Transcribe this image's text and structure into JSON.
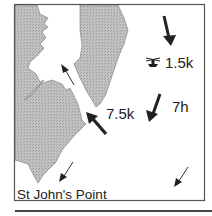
{
  "map": {
    "place_label": "St John's Point",
    "hour_label": "7h",
    "streams": [
      {
        "id": "offshore-north",
        "label": "1.5k",
        "has_slack_symbol": true
      },
      {
        "id": "channel-entrance",
        "label": "7.5k"
      }
    ],
    "icons": {
      "slack-water-symbol": "tidal-slack-icon"
    },
    "colors": {
      "land": "#b8b8b8",
      "sea": "#ffffff",
      "ink": "#222222",
      "frame": "#555555"
    }
  }
}
